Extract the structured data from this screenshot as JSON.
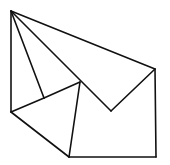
{
  "diagram": {
    "type": "geometric-line-figure",
    "stroke_color": "#111111",
    "background": "#ffffff",
    "vertices": {
      "A": [
        11,
        11
      ],
      "B": [
        155,
        69
      ],
      "C": [
        111,
        111
      ],
      "D": [
        80,
        82
      ],
      "E": [
        44,
        98
      ],
      "F": [
        11,
        112
      ],
      "G": [
        69,
        157
      ],
      "H": [
        156,
        157
      ]
    },
    "edges": [
      [
        "A",
        "B"
      ],
      [
        "B",
        "C"
      ],
      [
        "C",
        "A"
      ],
      [
        "A",
        "E"
      ],
      [
        "A",
        "F"
      ],
      [
        "F",
        "E"
      ],
      [
        "E",
        "D"
      ],
      [
        "D",
        "G"
      ],
      [
        "F",
        "G"
      ],
      [
        "G",
        "H"
      ],
      [
        "H",
        "B"
      ]
    ]
  }
}
